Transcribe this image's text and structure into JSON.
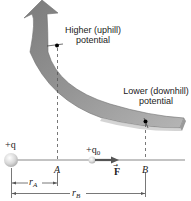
{
  "diagram": {
    "labels": {
      "higher_line1": "Higher (uphill)",
      "higher_line2": "potential",
      "lower_line1": "Lower (downhill)",
      "lower_line2": "potential",
      "source_charge": "+q",
      "test_charge_prefix": "+q",
      "test_charge_sub": "0",
      "point_a": "A",
      "point_b": "B",
      "force": "F",
      "force_vector_mark": "→",
      "r_a_main": "r",
      "r_a_sub": "A",
      "r_b_main": "r",
      "r_b_sub": "B"
    },
    "colors": {
      "arrow_fill": "#8a8a8a",
      "arrow_light": "#b8b8b8",
      "arrow_dark": "#6a6a6a",
      "line": "#777777",
      "text": "#222222"
    }
  }
}
